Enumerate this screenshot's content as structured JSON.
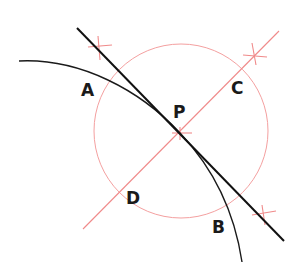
{
  "diagram": {
    "labels": {
      "A": "A",
      "B": "B",
      "C": "C",
      "D": "D",
      "P": "P"
    },
    "colors": {
      "construction": "#f08a8a",
      "curve": "#1a1a1a",
      "tangent": "#111111"
    }
  }
}
